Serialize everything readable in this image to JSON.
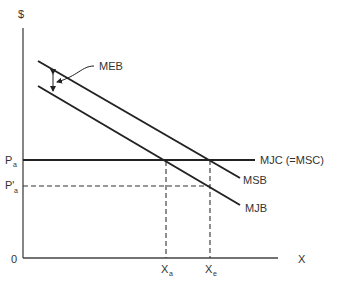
{
  "diagram": {
    "type": "economics-supply-demand",
    "y_axis_label": "$",
    "x_axis_label": "X",
    "origin_label": "0",
    "price_labels": {
      "pa": {
        "main": "P",
        "sub": "a"
      },
      "pa_prime": {
        "main": "P'",
        "sub": "a"
      }
    },
    "quantity_labels": {
      "xa": {
        "main": "X",
        "sub": "a"
      },
      "xe": {
        "main": "X",
        "sub": "e"
      }
    },
    "curves": {
      "msb": "MSB",
      "mjb": "MJB",
      "mjc": "MJC (=MSC)"
    },
    "annotation": {
      "meb": "MEB"
    },
    "colors": {
      "line": "#222222",
      "text": "#333333",
      "background": "#ffffff"
    }
  }
}
